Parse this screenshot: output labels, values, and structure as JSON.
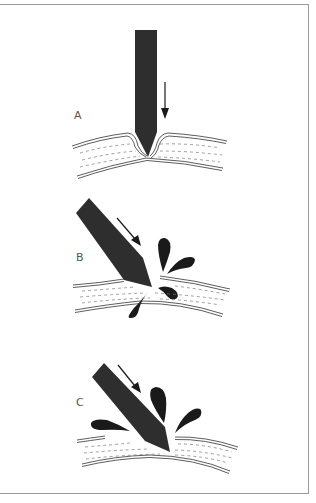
{
  "figure": {
    "colors": {
      "needle": "#2e2e2e",
      "ink": "#1a1a1a",
      "frame": "#9a9a9a",
      "label": "#555555"
    },
    "panels": [
      {
        "id": "A",
        "label": "A",
        "caption_hint": "needle pushes vertically, tissue dimples inward"
      },
      {
        "id": "B",
        "label": "B",
        "caption_hint": "angled needle pierces tissue, droplets splash"
      },
      {
        "id": "C",
        "label": "C",
        "caption_hint": "needle penetrates deeper, larger splash"
      }
    ]
  }
}
